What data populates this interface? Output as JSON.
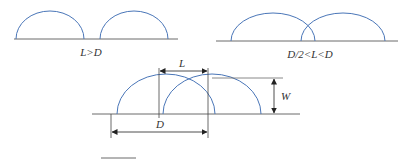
{
  "diagram": {
    "colors": {
      "arc": "#4a76b8",
      "line": "#6b6b6b",
      "text": "#333333"
    },
    "panels": [
      {
        "id": "top-left",
        "caption": "L>D"
      },
      {
        "id": "top-right",
        "caption": "D/2<L<D"
      },
      {
        "id": "bottom",
        "caption": ""
      }
    ],
    "dimensions": {
      "L": "L",
      "W": "W",
      "D": "D"
    }
  }
}
